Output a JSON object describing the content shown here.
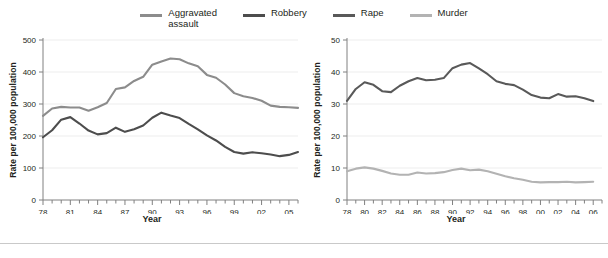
{
  "legend": {
    "items": [
      {
        "label": "Aggravated\nassault",
        "color": "#8c8c8c",
        "swatch": "legend-swatch-aggravated-assault"
      },
      {
        "label": "Robbery",
        "color": "#4d4d4d",
        "swatch": "legend-swatch-robbery"
      },
      {
        "label": "Rape",
        "color": "#595959",
        "swatch": "legend-swatch-rape"
      },
      {
        "label": "Murder",
        "color": "#b3b3b3",
        "swatch": "legend-swatch-murder"
      }
    ]
  },
  "chart_data": [
    {
      "type": "line",
      "panel": "left",
      "title": "",
      "xlabel": "Year",
      "ylabel": "Rate per 100,000 population",
      "xlim": [
        1978,
        2006
      ],
      "ylim": [
        0,
        500
      ],
      "yticks": [
        0,
        100,
        200,
        300,
        400,
        500
      ],
      "ytick_labels": [
        "0",
        "100",
        "200",
        "300",
        "400",
        "500"
      ],
      "xticks": [
        1978,
        1981,
        1984,
        1987,
        1990,
        1993,
        1996,
        1999,
        2002,
        2005
      ],
      "xtick_labels": [
        "78",
        "81",
        "84",
        "87",
        "90",
        "93",
        "96",
        "99",
        "02",
        "05"
      ],
      "xtick_minor_step": 1,
      "grid": "horizontal",
      "x": [
        1978,
        1979,
        1980,
        1981,
        1982,
        1983,
        1984,
        1985,
        1986,
        1987,
        1988,
        1989,
        1990,
        1991,
        1992,
        1993,
        1994,
        1995,
        1996,
        1997,
        1998,
        1999,
        2000,
        2001,
        2002,
        2003,
        2004,
        2005,
        2006
      ],
      "series": [
        {
          "name": "Aggravated assault",
          "color": "#8c8c8c",
          "values": [
            263,
            286,
            291,
            289,
            289,
            279,
            290,
            303,
            347,
            352,
            372,
            385,
            423,
            433,
            442,
            440,
            427,
            418,
            391,
            382,
            361,
            334,
            324,
            319,
            310,
            295,
            291,
            290,
            288
          ]
        },
        {
          "name": "Robbery",
          "color": "#4d4d4d",
          "values": [
            196,
            218,
            251,
            259,
            239,
            217,
            205,
            209,
            226,
            213,
            221,
            233,
            257,
            273,
            264,
            256,
            238,
            221,
            202,
            186,
            166,
            150,
            145,
            149,
            146,
            142,
            137,
            141,
            150
          ]
        }
      ]
    },
    {
      "type": "line",
      "panel": "right",
      "title": "",
      "xlabel": "Year",
      "ylabel": "Rate per 100,000 population",
      "xlim": [
        1978,
        2007
      ],
      "ylim": [
        0,
        50
      ],
      "yticks": [
        0,
        10,
        20,
        30,
        40,
        50
      ],
      "ytick_labels": [
        "0",
        "10",
        "20",
        "30",
        "40",
        "50"
      ],
      "xticks": [
        1978,
        1980,
        1982,
        1984,
        1986,
        1988,
        1990,
        1992,
        1994,
        1996,
        1998,
        2000,
        2002,
        2004,
        2006
      ],
      "xtick_labels": [
        "78",
        "80",
        "82",
        "84",
        "86",
        "88",
        "90",
        "92",
        "94",
        "96",
        "98",
        "00",
        "02",
        "04",
        "06"
      ],
      "xtick_minor_step": 1,
      "grid": "horizontal",
      "x": [
        1978,
        1979,
        1980,
        1981,
        1982,
        1983,
        1984,
        1985,
        1986,
        1987,
        1988,
        1989,
        1990,
        1991,
        1992,
        1993,
        1994,
        1995,
        1996,
        1997,
        1998,
        1999,
        2000,
        2001,
        2002,
        2003,
        2004,
        2005,
        2006
      ],
      "series": [
        {
          "name": "Rape",
          "color": "#595959",
          "values": [
            31.0,
            34.7,
            36.8,
            36.0,
            34.0,
            33.7,
            35.7,
            37.1,
            38.1,
            37.4,
            37.6,
            38.1,
            41.2,
            42.3,
            42.8,
            41.1,
            39.3,
            37.1,
            36.3,
            35.9,
            34.5,
            32.8,
            32.0,
            31.8,
            33.1,
            32.3,
            32.4,
            31.8,
            30.9
          ]
        },
        {
          "name": "Murder",
          "color": "#b3b3b3",
          "values": [
            9.0,
            9.8,
            10.2,
            9.8,
            9.1,
            8.3,
            7.9,
            7.9,
            8.6,
            8.3,
            8.4,
            8.7,
            9.4,
            9.8,
            9.3,
            9.5,
            9.0,
            8.2,
            7.4,
            6.8,
            6.3,
            5.7,
            5.5,
            5.6,
            5.6,
            5.7,
            5.5,
            5.6,
            5.7
          ]
        }
      ]
    }
  ]
}
